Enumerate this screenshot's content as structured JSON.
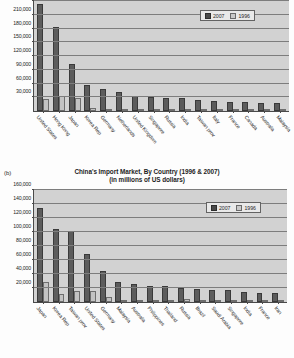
{
  "page": {
    "background_color": "#fdfdfd",
    "scan_note": ""
  },
  "figures": [
    {
      "id": "figure-a",
      "sub_label": "",
      "title": "",
      "subtitle": "",
      "legend": {
        "position": "top-right",
        "entries": [
          "2007",
          "1996"
        ]
      },
      "colors": {
        "series_2007": "#5c5c5c",
        "series_1996": "#c3c3c3",
        "plot_background": "#d2d2d2",
        "gridline": "#7d7d7d"
      },
      "chart_data": {
        "type": "bar",
        "title": "China's Export Market, By Country (1996 & 2007)",
        "subtitle": "(in millions of US dollars)",
        "xlabel": "",
        "ylabel": "",
        "ylim": [
          0,
          240000
        ],
        "grid": true,
        "legend_position": "top-right",
        "ytick_labels": [
          "30,000",
          "60,000",
          "90,000",
          "120,000",
          "150,000",
          "180,000",
          "210,000",
          "240,000"
        ],
        "ytick_values": [
          30000,
          60000,
          90000,
          120000,
          150000,
          180000,
          210000,
          240000
        ],
        "categories": [
          "United States",
          "Hong Kong",
          "Japan",
          "Korea Rep",
          "Germany",
          "Netherlands",
          "United Kingdom",
          "Singapore",
          "Russia",
          "India",
          "Taiwan prov",
          "Italy",
          "France",
          "Canada",
          "Australia",
          "Malaysia"
        ],
        "series": [
          {
            "name": "2007",
            "values": [
              233000,
              184000,
              102000,
              56000,
              48000,
              41000,
              32000,
              30000,
              29000,
              28000,
              23000,
              22000,
              20000,
              19000,
              18000,
              18000
            ]
          },
          {
            "name": "1996",
            "values": [
              27000,
              33000,
              29000,
              7500,
              4000,
              2500,
              2300,
              2200,
              1800,
              1400,
              1200,
              1500,
              1300,
              1500,
              1400,
              1300
            ]
          }
        ]
      }
    },
    {
      "id": "figure-b",
      "sub_label": "(b)",
      "title": "China's Import Market, By Country (1996 & 2007)",
      "subtitle": "(in millions of US dollars)",
      "legend": {
        "position": "top-right",
        "entries": [
          "2007",
          "1996"
        ]
      },
      "colors": {
        "series_2007": "#5c5c5c",
        "series_1996": "#c3c3c3",
        "plot_background": "#d2d2d2",
        "gridline": "#7d7d7d"
      },
      "chart_data": {
        "type": "bar",
        "title": "China's Import Market, By Country (1996 & 2007)",
        "subtitle": "(in millions of US dollars)",
        "xlabel": "",
        "ylabel": "",
        "ylim": [
          0,
          160000
        ],
        "grid": true,
        "legend_position": "top-right",
        "ytick_labels": [
          "20,000",
          "40,000",
          "60,000",
          "80,000",
          "100,000",
          "120,000",
          "140,000",
          "160,000"
        ],
        "ytick_values": [
          20000,
          40000,
          60000,
          80000,
          100000,
          120000,
          140000,
          160000
        ],
        "categories": [
          "Japan",
          "Korea Rep",
          "Taiwan prov",
          "United States",
          "Germany",
          "Malaysia",
          "Australia",
          "Philippines",
          "Thailand",
          "Russia",
          "Brazil",
          "Saudi Arabia",
          "Singapore",
          "India",
          "France",
          "Iran"
        ],
        "series": [
          {
            "name": "2007",
            "values": [
              134000,
              104000,
              101000,
              69000,
              45000,
              29000,
              26000,
              23000,
              23000,
              20000,
              18000,
              17000,
              17000,
              15000,
              13000,
              13000
            ]
          },
          {
            "name": "1996",
            "values": [
              29000,
              12000,
              16000,
              16000,
              7000,
              2400,
              3500,
              1000,
              1800,
              4500,
              1500,
              1100,
              3400,
              900,
              1800,
              500
            ]
          }
        ]
      }
    }
  ]
}
